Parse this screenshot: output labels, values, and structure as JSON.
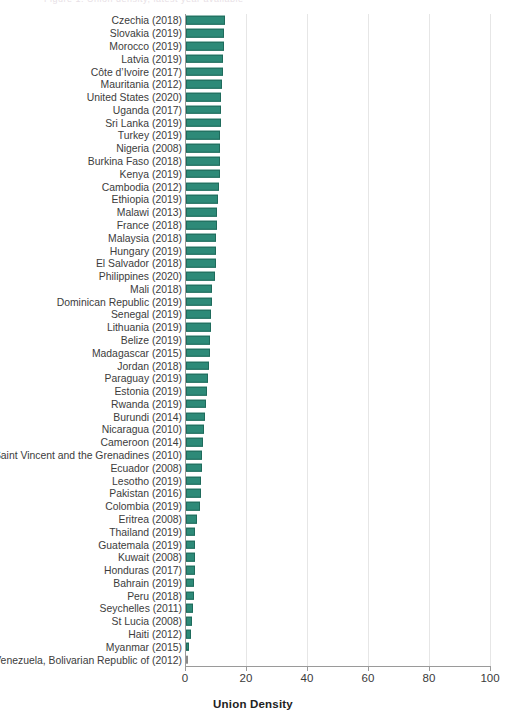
{
  "header": {
    "clipped_title": "Figure 1. Union density, latest year available"
  },
  "axis": {
    "x_title": "Union Density",
    "x_ticks": [
      0,
      20,
      40,
      60,
      80,
      100
    ],
    "x_min": 0,
    "x_max": 100
  },
  "colors": {
    "bar_fill": "#2d8a78",
    "bar_stroke": "#1f6b5c",
    "gridline": "#e6e6e6",
    "axis_line": "#9a9a9a",
    "label_text": "#3c3c3c"
  },
  "chart_data": {
    "type": "bar",
    "orientation": "horizontal",
    "title": "",
    "xlabel": "Union Density",
    "ylabel": "",
    "xlim": [
      0,
      100
    ],
    "grid": true,
    "legend": "none",
    "categories": [
      "Czechia (2018)",
      "Slovakia (2019)",
      "Morocco (2019)",
      "Latvia (2019)",
      "Côte d’Ivoire (2017)",
      "Mauritania (2012)",
      "United States (2020)",
      "Uganda (2017)",
      "Sri Lanka (2019)",
      "Turkey (2019)",
      "Nigeria (2008)",
      "Burkina Faso (2018)",
      "Kenya (2019)",
      "Cambodia (2012)",
      "Ethiopia (2019)",
      "Malawi (2013)",
      "France (2018)",
      "Malaysia (2018)",
      "Hungary (2019)",
      "El Salvador (2018)",
      "Philippines (2020)",
      "Mali (2018)",
      "Dominican Republic (2019)",
      "Senegal (2019)",
      "Lithuania (2019)",
      "Belize (2019)",
      "Madagascar (2015)",
      "Jordan (2018)",
      "Paraguay (2019)",
      "Estonia (2019)",
      "Rwanda (2019)",
      "Burundi (2014)",
      "Nicaragua (2010)",
      "Cameroon (2014)",
      "Saint Vincent and the Grenadines (2010)",
      "Ecuador (2008)",
      "Lesotho (2019)",
      "Pakistan (2016)",
      "Colombia (2019)",
      "Eritrea (2008)",
      "Thailand (2019)",
      "Guatemala (2019)",
      "Kuwait (2008)",
      "Honduras (2017)",
      "Bahrain (2019)",
      "Peru (2018)",
      "Seychelles (2011)",
      "St Lucia (2008)",
      "Haiti (2012)",
      "Myanmar (2015)",
      "Venezuela, Bolivarian Republic of (2012)"
    ],
    "values": [
      12.8,
      12.4,
      12.3,
      12.2,
      12.0,
      11.8,
      11.6,
      11.5,
      11.4,
      11.3,
      11.2,
      11.1,
      11.0,
      10.8,
      10.5,
      10.2,
      10.0,
      9.9,
      9.8,
      9.7,
      9.4,
      8.5,
      8.4,
      8.3,
      8.2,
      8.0,
      7.9,
      7.5,
      7.2,
      6.8,
      6.5,
      6.2,
      5.9,
      5.6,
      5.3,
      5.1,
      5.0,
      4.9,
      4.7,
      3.6,
      3.1,
      3.0,
      2.9,
      2.8,
      2.7,
      2.5,
      2.2,
      2.0,
      1.8,
      1.1,
      0.2
    ],
    "ylabel_order": "descending"
  }
}
